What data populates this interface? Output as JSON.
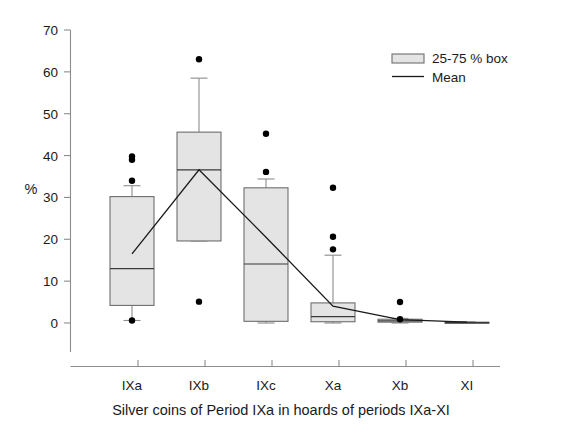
{
  "chart_data": {
    "type": "box",
    "title": "",
    "caption": "Silver coins of Period IXa in hoards of periods IXa-XI",
    "xlabel": "Silver coins of Period IXa in hoards of periods IXa-XI",
    "ylabel": "%",
    "ylim": [
      0,
      70
    ],
    "yticks": [
      0,
      10,
      20,
      30,
      40,
      50,
      60,
      70
    ],
    "ytick_labels": [
      "0",
      "10",
      "20",
      "30",
      "40",
      "50",
      "60",
      "70"
    ],
    "grid": false,
    "categories": [
      "IXa",
      "IXb",
      "IXc",
      "Xa",
      "Xb",
      "XI"
    ],
    "legend": {
      "position": "top-right",
      "entries": [
        {
          "label": "25-75 % box",
          "marker": "box"
        },
        {
          "label": "Mean",
          "marker": "line"
        }
      ]
    },
    "boxes": [
      {
        "category": "IXa",
        "q1": 4.2,
        "median": 13.0,
        "q3": 30.2,
        "whisker_low": 0.6,
        "whisker_high": 32.8,
        "mean": 16.5,
        "outliers": [
          39.8,
          39.0,
          34.0,
          0.6
        ]
      },
      {
        "category": "IXb",
        "q1": 19.6,
        "median": 36.6,
        "q3": 45.6,
        "whisker_low": 19.6,
        "whisker_high": 58.5,
        "mean": 36.6,
        "outliers": [
          63.0,
          5.1
        ]
      },
      {
        "category": "IXc",
        "q1": 0.4,
        "median": 14.1,
        "q3": 32.3,
        "whisker_low": 0.0,
        "whisker_high": 34.4,
        "mean": 20.5,
        "outliers": [
          45.2,
          36.1
        ]
      },
      {
        "category": "Xa",
        "q1": 0.3,
        "median": 1.5,
        "q3": 4.8,
        "whisker_low": 0.0,
        "whisker_high": 16.2,
        "mean": 4.0,
        "outliers": [
          32.3,
          20.6,
          17.6
        ]
      },
      {
        "category": "Xb",
        "q1": 0.2,
        "median": 0.5,
        "q3": 0.9,
        "whisker_low": 0.0,
        "whisker_high": 1.1,
        "mean": 0.8,
        "outliers": [
          5.0,
          0.9
        ]
      },
      {
        "category": "XI",
        "q1": 0.0,
        "median": 0.1,
        "q3": 0.2,
        "whisker_low": 0.0,
        "whisker_high": 0.3,
        "mean": 0.2,
        "outliers": []
      }
    ],
    "mean_series": {
      "name": "Mean",
      "x": [
        "IXa",
        "IXb",
        "IXc",
        "Xa",
        "Xb",
        "XI"
      ],
      "values": [
        16.5,
        36.6,
        20.5,
        4.0,
        0.8,
        0.2
      ]
    }
  },
  "axes": {
    "y_title": "%",
    "y_tick_labels": [
      "70",
      "60",
      "50",
      "40",
      "30",
      "20",
      "10",
      "0"
    ],
    "x_tick_labels": [
      "IXa",
      "IXb",
      "IXc",
      "Xa",
      "Xb",
      "XI"
    ]
  },
  "legend": {
    "box_label": "25-75 % box",
    "mean_label": "Mean"
  },
  "caption": {
    "text": "Silver coins of Period IXa in hoards of periods IXa-XI"
  },
  "colors": {
    "box_fill": "#e4e4e4",
    "box_stroke": "#6e6e6e",
    "axis": "#8c8c8c",
    "mean_line": "#1a1a1a",
    "outlier": "#000000",
    "background": "#ffffff"
  }
}
